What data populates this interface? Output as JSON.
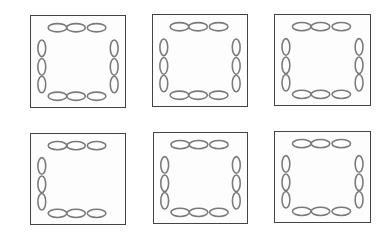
{
  "figure": {
    "colors": {
      "border": "#444444",
      "ellipse": "#7a7a7a",
      "background": "#ffffff"
    },
    "panels": [
      {
        "id": 1,
        "x": 30,
        "y": 15,
        "w": 96,
        "h": 93,
        "top": 3,
        "bottom": 3,
        "left": 3,
        "right": 3
      },
      {
        "id": 2,
        "x": 152,
        "y": 14,
        "w": 96,
        "h": 93,
        "top": 3,
        "bottom": 3,
        "left": 3,
        "right": 3
      },
      {
        "id": 3,
        "x": 274,
        "y": 14,
        "w": 97,
        "h": 92,
        "top": 3,
        "bottom": 3,
        "left": 3,
        "right": 3
      },
      {
        "id": 4,
        "x": 30,
        "y": 133,
        "w": 96,
        "h": 92,
        "top": 3,
        "bottom": 3,
        "left": 3,
        "right": 0
      },
      {
        "id": 5,
        "x": 153,
        "y": 132,
        "w": 95,
        "h": 92,
        "top": 3,
        "bottom": 3,
        "left": 3,
        "right": 3
      },
      {
        "id": 6,
        "x": 274,
        "y": 131,
        "w": 97,
        "h": 92,
        "top": 3,
        "bottom": 3,
        "left": 3,
        "right": 3
      }
    ]
  }
}
